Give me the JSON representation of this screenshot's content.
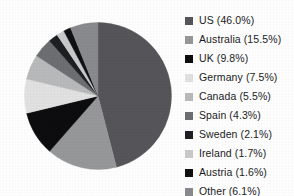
{
  "chart_data": {
    "type": "pie",
    "title": "",
    "legend_position": "right",
    "start_angle_deg": 0,
    "direction": "clockwise",
    "categories": [
      "US",
      "Australia",
      "UK",
      "Germany",
      "Canada",
      "Spain",
      "Sweden",
      "Ireland",
      "Austria",
      "Other"
    ],
    "values": [
      46.0,
      15.5,
      9.8,
      7.5,
      5.5,
      4.3,
      2.1,
      1.7,
      1.6,
      6.1
    ],
    "unit": "%",
    "colors": [
      "#56565a",
      "#97989a",
      "#0d0d0f",
      "#e2e2e2",
      "#b9babb",
      "#6e6f72",
      "#1e1f22",
      "#c9cacb",
      "#111113",
      "#8a8b8e"
    ],
    "slices": [
      {
        "label": "US",
        "value": 46.0,
        "color": "#56565a",
        "legend_text": "US (46.0%)"
      },
      {
        "label": "Australia",
        "value": 15.5,
        "color": "#97989a",
        "legend_text": "Australia (15.5%)"
      },
      {
        "label": "UK",
        "value": 9.8,
        "color": "#0d0d0f",
        "legend_text": "UK (9.8%)"
      },
      {
        "label": "Germany",
        "value": 7.5,
        "color": "#e2e2e2",
        "legend_text": "Germany (7.5%)"
      },
      {
        "label": "Canada",
        "value": 5.5,
        "color": "#b9babb",
        "legend_text": "Canada (5.5%)"
      },
      {
        "label": "Spain",
        "value": 4.3,
        "color": "#6e6f72",
        "legend_text": "Spain (4.3%)"
      },
      {
        "label": "Sweden",
        "value": 2.1,
        "color": "#1e1f22",
        "legend_text": "Sweden (2.1%)"
      },
      {
        "label": "Ireland",
        "value": 1.7,
        "color": "#c9cacb",
        "legend_text": "Ireland (1.7%)"
      },
      {
        "label": "Austria",
        "value": 1.6,
        "color": "#111113",
        "legend_text": "Austria (1.6%)"
      },
      {
        "label": "Other",
        "value": 6.1,
        "color": "#8a8b8e",
        "legend_text": "Other (6.1%)"
      }
    ]
  },
  "legend": {
    "items": [
      {
        "text": "US (46.0%)",
        "color": "#56565a"
      },
      {
        "text": "Australia (15.5%)",
        "color": "#97989a"
      },
      {
        "text": "UK (9.8%)",
        "color": "#0d0d0f"
      },
      {
        "text": "Germany (7.5%)",
        "color": "#e2e2e2"
      },
      {
        "text": "Canada (5.5%)",
        "color": "#b9babb"
      },
      {
        "text": "Spain (4.3%)",
        "color": "#6e6f72"
      },
      {
        "text": "Sweden (2.1%)",
        "color": "#1e1f22"
      },
      {
        "text": "Ireland (1.7%)",
        "color": "#c9cacb"
      },
      {
        "text": "Austria (1.6%)",
        "color": "#111113"
      },
      {
        "text": "Other (6.1%)",
        "color": "#8a8b8e"
      }
    ]
  },
  "background_color": "#ffffff"
}
